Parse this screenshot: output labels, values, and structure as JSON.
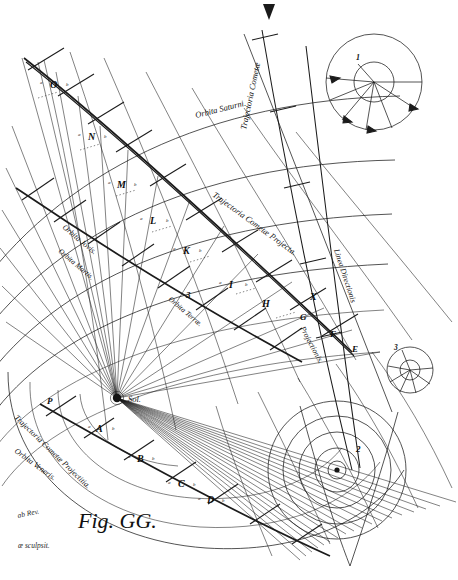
{
  "plate": {
    "figure_caption": "Fig. GG.",
    "background_color": "#ffffff",
    "ink_color": "#1b1b1b",
    "engraver_line": "æ sculpsit.",
    "designer_line": "ab Rev."
  },
  "labels": {
    "orbita_saturni": "Orbita Saturni.",
    "trajectoria_cometae_top": "Trajectoria Cometæ",
    "linea_directionis": "Linea Directionis",
    "linea_projectionis": "Projectionis.",
    "trajectoria_cometae_projecta": "Trajectoria Cometæ Projecta.",
    "trajectoria_cometae_projectitia": "Trajectoria Cometæ Projectitia.",
    "orbita_jovis": "Orbita Jovis.",
    "orbita_martis": "Orbita Martis.",
    "orbita_veneris": "Orbita Veneris.",
    "orbita_terrae": "Orbita Terræ.",
    "sol": "Sol."
  },
  "trajectory_points": [
    {
      "letter": "O",
      "x": 50,
      "y": 88
    },
    {
      "letter": "N",
      "x": 88,
      "y": 140
    },
    {
      "letter": "M",
      "x": 117,
      "y": 188
    },
    {
      "letter": "L",
      "x": 150,
      "y": 224
    },
    {
      "letter": "K",
      "x": 183,
      "y": 254
    },
    {
      "letter": "I",
      "x": 229,
      "y": 288
    },
    {
      "letter": "H",
      "x": 262,
      "y": 307
    },
    {
      "letter": "X",
      "x": 310,
      "y": 300
    },
    {
      "letter": "G",
      "x": 300,
      "y": 320
    },
    {
      "letter": "F",
      "x": 330,
      "y": 337
    },
    {
      "letter": "E",
      "x": 352,
      "y": 352
    },
    {
      "letter": "A",
      "x": 96,
      "y": 432
    },
    {
      "letter": "B",
      "x": 137,
      "y": 462
    },
    {
      "letter": "C",
      "x": 178,
      "y": 487
    },
    {
      "letter": "D",
      "x": 207,
      "y": 503
    },
    {
      "letter": "P",
      "x": 47,
      "y": 404
    }
  ],
  "insets": [
    {
      "id": "inset-1",
      "number": "1",
      "cx": 374,
      "cy": 82,
      "r_outer": 48,
      "r_inner": 20,
      "rays": 8
    },
    {
      "id": "inset-3",
      "number": "3",
      "cx": 410,
      "cy": 370,
      "r_outer": 23,
      "r_inner": 9,
      "rays": 8
    },
    {
      "id": "inset-2",
      "number": "2",
      "cx": 337,
      "cy": 470,
      "rings": [
        9,
        22,
        38,
        54,
        69
      ],
      "rays": 3
    }
  ],
  "orbit_rings": {
    "count": 6,
    "note": "concentric arcs centred on Sol"
  },
  "scale_numerals": [
    "3"
  ],
  "marker": {
    "name": "top-arrowhead",
    "x": 268,
    "y": 8
  }
}
